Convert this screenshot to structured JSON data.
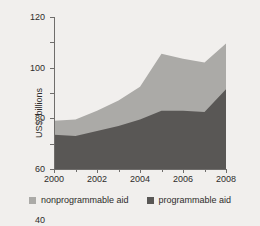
{
  "chart_data": {
    "type": "area",
    "stacked": true,
    "title": "",
    "xlabel": "",
    "ylabel": "US$, billions",
    "x": [
      2000,
      2001,
      2002,
      2003,
      2004,
      2005,
      2006,
      2007,
      2008
    ],
    "xlim": [
      2000,
      2008
    ],
    "ylim": [
      0,
      120
    ],
    "yticks": [
      0,
      20,
      40,
      60,
      80,
      100,
      120
    ],
    "xticks": [
      2000,
      2002,
      2004,
      2006,
      2008
    ],
    "xticks_minor": [
      2001,
      2003,
      2005,
      2007
    ],
    "grid": false,
    "legend_position": "bottom",
    "series": [
      {
        "name": "programmable aid",
        "color": "#595755",
        "values": [
          27,
          26,
          30,
          34,
          39,
          46,
          46,
          45,
          63
        ]
      },
      {
        "name": "nonprogrammable aid",
        "color": "#abaaa7",
        "values": [
          11,
          13,
          16,
          20,
          26,
          45,
          41,
          39,
          36
        ]
      }
    ],
    "totals": [
      38,
      39,
      46,
      54,
      65,
      91,
      87,
      84,
      99
    ]
  },
  "axis": {
    "y_title": "US$, billions",
    "y_tick_labels": [
      "0",
      "20",
      "40",
      "60",
      "80",
      "100",
      "120"
    ],
    "x_tick_labels": [
      "2000",
      "2002",
      "2004",
      "2006",
      "2008"
    ]
  },
  "legend": {
    "items": [
      {
        "label": "nonprogrammable aid",
        "color": "#abaaa7"
      },
      {
        "label": "programmable aid",
        "color": "#595755"
      }
    ]
  },
  "colors": {
    "background": "#f1efed",
    "axis": "#6f6d6b",
    "text": "#2e2c2b",
    "programmable": "#595755",
    "nonprogrammable": "#abaaa7"
  }
}
